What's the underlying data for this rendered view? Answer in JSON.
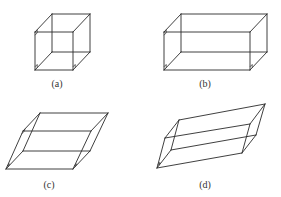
{
  "figure": {
    "panels": [
      {
        "id": "a",
        "label": "(a)",
        "shape": "cube",
        "front": [
          [
            35,
            70
          ],
          [
            73,
            70
          ],
          [
            73,
            32
          ],
          [
            35,
            32
          ]
        ],
        "back": [
          [
            52,
            52
          ],
          [
            90,
            52
          ],
          [
            90,
            14
          ],
          [
            52,
            14
          ]
        ],
        "label_pos": [
          57,
          87
        ],
        "right_angle_marks": [
          [
            35,
            70
          ],
          [
            73,
            70
          ],
          [
            35,
            32
          ]
        ]
      },
      {
        "id": "b",
        "label": "(b)",
        "shape": "rectangular-box",
        "front": [
          [
            164,
            70
          ],
          [
            250,
            70
          ],
          [
            250,
            32
          ],
          [
            164,
            32
          ]
        ],
        "back": [
          [
            181,
            52
          ],
          [
            267,
            52
          ],
          [
            267,
            14
          ],
          [
            181,
            14
          ]
        ],
        "label_pos": [
          205,
          87
        ],
        "right_angle_marks": [
          [
            164,
            70
          ],
          [
            250,
            70
          ],
          [
            164,
            32
          ]
        ]
      },
      {
        "id": "c",
        "label": "(c)",
        "shape": "parallelepiped",
        "front": [
          [
            6,
            169
          ],
          [
            73,
            169
          ],
          [
            91,
            131
          ],
          [
            23,
            131
          ]
        ],
        "back": [
          [
            23,
            151
          ],
          [
            90,
            151
          ],
          [
            108,
            113
          ],
          [
            40,
            113
          ]
        ],
        "label_pos": [
          49,
          188
        ],
        "right_angle_marks": [
          [
            6,
            169
          ],
          [
            73,
            169
          ],
          [
            23,
            131
          ]
        ]
      },
      {
        "id": "d",
        "label": "(d)",
        "shape": "oblique-parallelepiped",
        "front": [
          [
            157,
            168
          ],
          [
            242,
            153
          ],
          [
            250,
            124
          ],
          [
            165,
            138
          ]
        ],
        "back": [
          [
            171,
            150
          ],
          [
            256,
            135
          ],
          [
            265,
            104
          ],
          [
            179,
            120
          ]
        ],
        "label_pos": [
          205,
          188
        ],
        "right_angle_marks": [
          [
            157,
            168
          ]
        ]
      }
    ],
    "colors": {
      "stroke": "#2a2a2a",
      "label": "#333333",
      "background": "#ffffff"
    }
  }
}
